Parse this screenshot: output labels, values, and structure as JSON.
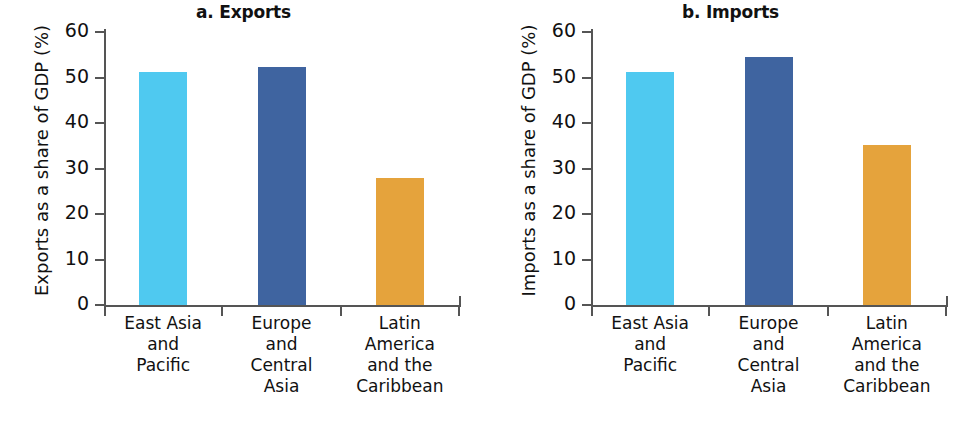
{
  "figure": {
    "panels": [
      {
        "id": "exports",
        "title": "a. Exports",
        "ylabel": "Exports as a share of GDP (%)"
      },
      {
        "id": "imports",
        "title": "b. Imports",
        "ylabel": "Imports as a share of GDP (%)"
      }
    ]
  },
  "colors": {
    "east_asia_and_pacific": "#4FC9F0",
    "europe_and_central_asia": "#3F64A0",
    "latin_america_and_the_caribbean": "#E5A33C",
    "axis": "#555555",
    "text": "#111111",
    "background": "#FFFFFF"
  },
  "chart_data": [
    {
      "type": "bar",
      "title": "a. Exports",
      "xlabel": "",
      "ylabel": "Exports as a share of GDP (%)",
      "categories": [
        "East Asia\nand\nPacific",
        "Europe\nand\nCentral\nAsia",
        "Latin\nAmerica\nand the\nCaribbean"
      ],
      "category_lines": [
        [
          "East Asia",
          "and",
          "Pacific"
        ],
        [
          "Europe",
          "and",
          "Central",
          "Asia"
        ],
        [
          "Latin",
          "America",
          "and the",
          "Caribbean"
        ]
      ],
      "values": [
        51.2,
        52.3,
        28.0
      ],
      "bar_colors": [
        "#4FC9F0",
        "#3F64A0",
        "#E5A33C"
      ],
      "ylim": [
        0,
        60
      ],
      "yticks": [
        0,
        10,
        20,
        30,
        40,
        50,
        60
      ],
      "ytick_labels": [
        "0",
        "10",
        "20",
        "30",
        "40",
        "50",
        "60"
      ],
      "grid": false,
      "legend": false
    },
    {
      "type": "bar",
      "title": "b. Imports",
      "xlabel": "",
      "ylabel": "Imports as a share of GDP (%)",
      "categories": [
        "East Asia\nand\nPacific",
        "Europe\nand\nCentral\nAsia",
        "Latin\nAmerica\nand the\nCaribbean"
      ],
      "category_lines": [
        [
          "East Asia",
          "and",
          "Pacific"
        ],
        [
          "Europe",
          "and",
          "Central",
          "Asia"
        ],
        [
          "Latin",
          "America",
          "and the",
          "Caribbean"
        ]
      ],
      "values": [
        51.2,
        54.5,
        35.2
      ],
      "bar_colors": [
        "#4FC9F0",
        "#3F64A0",
        "#E5A33C"
      ],
      "ylim": [
        0,
        60
      ],
      "yticks": [
        0,
        10,
        20,
        30,
        40,
        50,
        60
      ],
      "ytick_labels": [
        "0",
        "10",
        "20",
        "30",
        "40",
        "50",
        "60"
      ],
      "grid": false,
      "legend": false
    }
  ]
}
